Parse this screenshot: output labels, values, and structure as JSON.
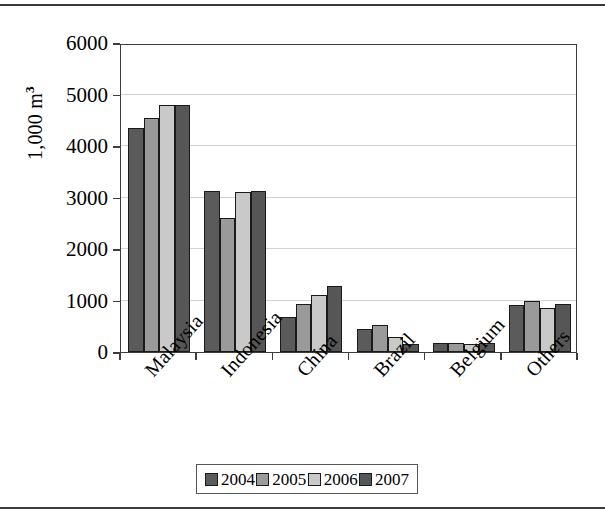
{
  "chart_data": {
    "type": "bar",
    "title": "",
    "subtitle": "",
    "xlabel": "",
    "ylabel": "1,000 m",
    "ylabel_superscript": "3",
    "ylim": [
      0,
      6000
    ],
    "ytick_values": [
      0,
      1000,
      2000,
      3000,
      4000,
      5000,
      6000
    ],
    "ytick_labels": [
      "0",
      "1000",
      "2000",
      "3000",
      "4000",
      "5000",
      "6000"
    ],
    "grid": true,
    "grid_axis": "y",
    "legend_position": "bottom",
    "categories": [
      "Malaysia",
      "Indonesia",
      "China",
      "Brazil",
      "Belgium",
      "Others"
    ],
    "series": [
      {
        "name": "2004",
        "color": "#5b5b5b",
        "values": [
          4350,
          3120,
          680,
          450,
          180,
          920
        ]
      },
      {
        "name": "2005",
        "color": "#9a9a9a",
        "values": [
          4540,
          2600,
          930,
          530,
          175,
          1000
        ]
      },
      {
        "name": "2006",
        "color": "#c9c9c9",
        "values": [
          4800,
          3100,
          1110,
          300,
          165,
          860
        ]
      },
      {
        "name": "2007",
        "color": "#565656",
        "values": [
          4800,
          3120,
          1290,
          160,
          175,
          930
        ]
      }
    ]
  },
  "legend": {
    "entries": [
      {
        "label": "2004"
      },
      {
        "label": "2005"
      },
      {
        "label": "2006"
      },
      {
        "label": "2007"
      }
    ]
  },
  "colors": {
    "axis": "#3d3d3d",
    "gridline": "#d2d2d2",
    "bar_outline": "#1a1a1a",
    "page_rule": "#3a3a3a",
    "background": "#ffffff"
  }
}
